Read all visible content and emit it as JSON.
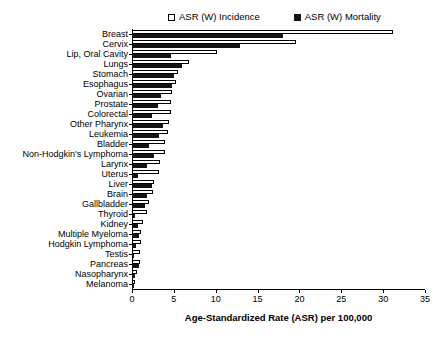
{
  "chart_data": {
    "type": "bar",
    "orientation": "horizontal",
    "title": "",
    "xlabel": "Age-Standardized Rate (ASR) per 100,000",
    "ylabel": "",
    "xlim": [
      0,
      35
    ],
    "xticks": [
      0,
      5,
      10,
      15,
      20,
      25,
      30,
      35
    ],
    "grid": false,
    "legend_position": "top",
    "categories": [
      "Breast",
      "Cervix",
      "Lip, Oral Cavity",
      "Lungs",
      "Stomach",
      "Esophagus",
      "Ovarian",
      "Prostate",
      "Colorectal",
      "Other Pharynx",
      "Leukemia",
      "Bladder",
      "Non-Hodgkin's Lymphoma",
      "Larynx",
      "Uterus",
      "Liver",
      "Brain",
      "Gallbladder",
      "Thyroid",
      "Kidney",
      "Multiple Myeloma",
      "Hodgkin Lymphoma",
      "Testis",
      "Pancreas",
      "Nasopharynx",
      "Melanoma"
    ],
    "series": [
      {
        "name": "ASR (W) Incidence",
        "color": "#ffffff",
        "edge_color": "#000000",
        "values": [
          31.2,
          19.6,
          10.2,
          6.8,
          5.5,
          5.2,
          4.8,
          4.6,
          4.6,
          4.4,
          4.3,
          3.9,
          3.9,
          3.3,
          3.2,
          2.6,
          2.5,
          2.0,
          1.8,
          1.3,
          1.1,
          1.1,
          0.9,
          0.9,
          0.6,
          0.3
        ]
      },
      {
        "name": "ASR (W) Mortality",
        "color": "#151515",
        "edge_color": "#151515",
        "values": [
          18.0,
          12.9,
          4.7,
          6.0,
          5.0,
          4.8,
          3.5,
          3.1,
          2.4,
          3.7,
          3.2,
          2.0,
          2.6,
          1.8,
          0.7,
          2.4,
          1.8,
          1.5,
          0.4,
          0.7,
          0.8,
          0.5,
          0.2,
          0.8,
          0.4,
          0.1
        ]
      }
    ]
  },
  "legend": {
    "entries": [
      {
        "label": "ASR (W) Incidence",
        "style": "open"
      },
      {
        "label": "ASR (W) Mortality",
        "style": "filled"
      }
    ]
  },
  "axis": {
    "x_title": "Age-Standardized Rate (ASR) per 100,000",
    "tick_labels": [
      "0",
      "5",
      "10",
      "15",
      "20",
      "25",
      "30",
      "35"
    ]
  }
}
